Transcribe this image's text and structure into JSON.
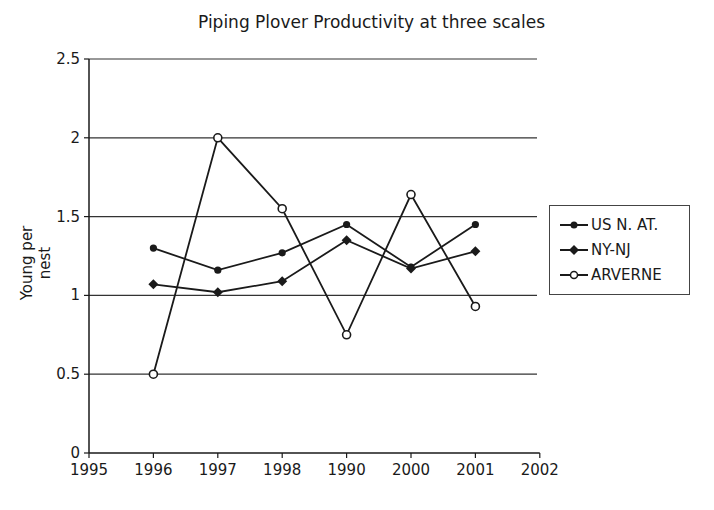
{
  "chart_data": {
    "type": "line",
    "title": "Piping Plover Productivity at three scales",
    "xlabel": "",
    "ylabel": "Young per nest",
    "x_ticks": [
      "1995",
      "1996",
      "1997",
      "1998",
      "1990",
      "2000",
      "2001",
      "2002"
    ],
    "categories": [
      "1996",
      "1997",
      "1998",
      "1990",
      "2000",
      "2001"
    ],
    "ylim": [
      0,
      2.5
    ],
    "y_ticks": [
      "0",
      "0.5",
      "1",
      "1.5",
      "2",
      "2.5"
    ],
    "grid": "horizontal",
    "legend_position": "right",
    "series": [
      {
        "name": "US N. AT.",
        "marker": "circle-filled",
        "values": [
          1.3,
          1.16,
          1.27,
          1.45,
          1.18,
          1.45
        ]
      },
      {
        "name": "NY-NJ",
        "marker": "diamond-filled",
        "values": [
          1.07,
          1.02,
          1.09,
          1.35,
          1.17,
          1.28
        ]
      },
      {
        "name": "ARVERNE",
        "marker": "circle-open",
        "values": [
          0.5,
          2.0,
          1.55,
          0.75,
          1.64,
          0.93
        ]
      }
    ],
    "colors": {
      "line": "#1a1a1a",
      "grid": "#333333",
      "background": "#ffffff"
    }
  }
}
